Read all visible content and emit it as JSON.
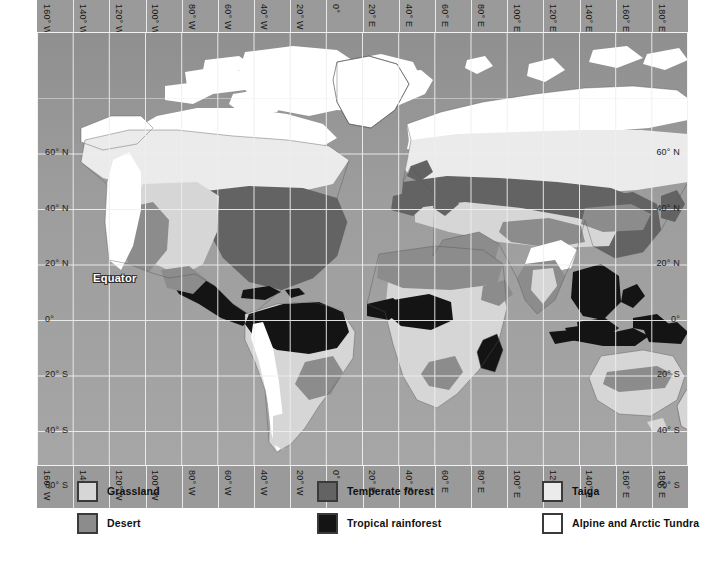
{
  "map": {
    "title": "World Biomes Map",
    "projection": "equirectangular",
    "equator_label": "Equator",
    "ocean_color": "#9a9a9a",
    "grid_color": "#efefef",
    "coastline_color": "#4a4a4a",
    "longitude_labels_top": [
      "160° W",
      "140° W",
      "120° W",
      "100° W",
      "80° W",
      "60° W",
      "40° W",
      "20° W",
      "0°",
      "20° E",
      "40° E",
      "60° E",
      "80° E",
      "100° E",
      "120° E",
      "140° E",
      "160° E",
      "180° E"
    ],
    "longitude_labels_bottom": [
      "160° W",
      "140° W",
      "120° W",
      "100° W",
      "80° W",
      "60° W",
      "40° W",
      "20° W",
      "0°",
      "20° E",
      "40° E",
      "60° E",
      "80° E",
      "100° E",
      "120° E",
      "140° E",
      "160° E",
      "180° E"
    ],
    "latitude_labels_left": [
      "60° N",
      "40° N",
      "20° N",
      "0°",
      "20° S",
      "40° S",
      "60° S"
    ],
    "latitude_labels_right": [
      "60° N",
      "40° N",
      "20° N",
      "0°",
      "20° S",
      "40° S",
      "60° S"
    ]
  },
  "legend": {
    "items": [
      {
        "label": "Grassland",
        "color": "#d6d6d6"
      },
      {
        "label": "Desert",
        "color": "#8c8c8c"
      },
      {
        "label": "Temperate forest",
        "color": "#636363"
      },
      {
        "label": "Tropical rainforest",
        "color": "#141414"
      },
      {
        "label": "Taiga",
        "color": "#ebebeb"
      },
      {
        "label": "Alpine and Arctic Tundra",
        "color": "#ffffff"
      }
    ]
  },
  "chart_data": {
    "type": "map",
    "x_range": [
      -180,
      180
    ],
    "y_range": [
      -75,
      83
    ],
    "grid": true,
    "biome_categories": [
      "Grassland",
      "Desert",
      "Temperate forest",
      "Tropical rainforest",
      "Taiga",
      "Alpine and Arctic Tundra"
    ]
  }
}
